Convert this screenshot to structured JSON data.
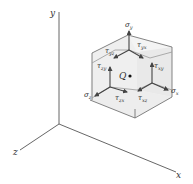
{
  "diagram": {
    "title": "",
    "axes": {
      "x_label": "x",
      "y_label": "y",
      "z_label": "z"
    },
    "point": {
      "label": "Q"
    },
    "stresses": [
      {
        "id": "sigma_y",
        "symbol": "σ",
        "sub": "y",
        "face": "top",
        "direction": "normal"
      },
      {
        "id": "tau_yx",
        "symbol": "τ",
        "sub": "yx",
        "face": "top",
        "direction": "x"
      },
      {
        "id": "tau_yz",
        "symbol": "τ",
        "sub": "yz",
        "face": "top",
        "direction": "z"
      },
      {
        "id": "sigma_x",
        "symbol": "σ",
        "sub": "x",
        "face": "right",
        "direction": "normal"
      },
      {
        "id": "tau_xy",
        "symbol": "τ",
        "sub": "xy",
        "face": "right",
        "direction": "y"
      },
      {
        "id": "tau_xz",
        "symbol": "τ",
        "sub": "xz",
        "face": "right",
        "direction": "z"
      },
      {
        "id": "sigma_z",
        "symbol": "σ",
        "sub": "z",
        "face": "front",
        "direction": "normal"
      },
      {
        "id": "tau_zy",
        "symbol": "τ",
        "sub": "zy",
        "face": "front",
        "direction": "y"
      },
      {
        "id": "tau_zx",
        "symbol": "τ",
        "sub": "zx",
        "face": "front",
        "direction": "x"
      }
    ],
    "colors": {
      "line": "#666666",
      "arrow": "#444444",
      "face_light": "#f4f4f4",
      "face_dark": "#e9e9e9"
    }
  }
}
